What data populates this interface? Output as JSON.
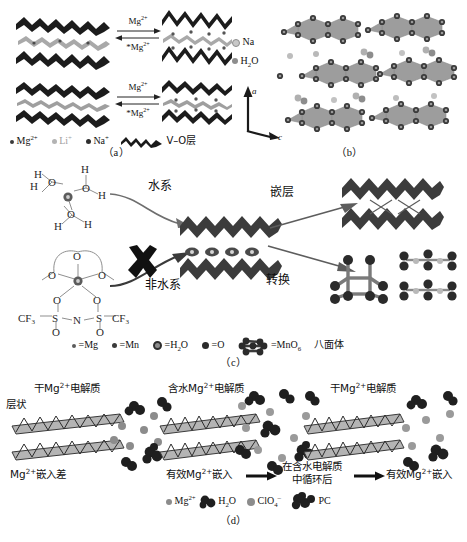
{
  "figure": {
    "panels": [
      {
        "id": "a",
        "label": "（a）"
      },
      {
        "id": "b",
        "label": "（b）"
      },
      {
        "id": "c",
        "label": "（c）"
      },
      {
        "id": "d",
        "label": "（d）"
      }
    ]
  },
  "panel_a": {
    "arrow_top_label": "Mg2+",
    "arrow_bottom_label": "*Mg2+",
    "arrow_top_label_sup": "2+",
    "arrow_bottom_label_sup": "2+",
    "rows": [
      {
        "left": "layered-host-narrow",
        "right": "layered-host-expanded"
      },
      {
        "left": "layered-host-narrow",
        "right": "layered-host-expanded"
      }
    ],
    "legend": [
      {
        "symbol": "dot-small-dark",
        "label": "Mg",
        "charge": "2+",
        "color": "#3a3a3a",
        "size": 4
      },
      {
        "symbol": "dot-light",
        "label": "Li",
        "charge": "+",
        "color": "#b3b3b3",
        "size": 5
      },
      {
        "symbol": "dot-dark",
        "label": "Na",
        "charge": "+",
        "color": "#2e2e2e",
        "size": 5
      },
      {
        "symbol": "vo-layer-glyph",
        "label": "V–O层",
        "charge": "",
        "color": "#1a1a1a",
        "size": 0
      }
    ]
  },
  "panel_b": {
    "legend": [
      {
        "symbol": "dot-light",
        "label": "Na",
        "color": "#9a9a9a"
      },
      {
        "symbol": "dot-dark",
        "label": "H2O",
        "label_sub": "2",
        "color": "#6e6e6e"
      }
    ],
    "axes": [
      {
        "label": "a",
        "direction": "up"
      },
      {
        "label": "c",
        "direction": "down-right"
      }
    ],
    "structure": "layered-crystal-with-polyhedra"
  },
  "panel_c": {
    "aqueous_label": "水系",
    "nonaqueous_label": "非水系",
    "intercalation_label": "嵌层",
    "conversion_label": "转换",
    "blocked_marker": "X",
    "hydrated_species": {
      "center": "Mg",
      "waters": [
        {
          "o": "O",
          "h": [
            "H",
            "H"
          ]
        },
        {
          "o": "O",
          "h": [
            "H",
            "H"
          ]
        },
        {
          "o": "O",
          "h": [
            "H",
            "H"
          ]
        }
      ]
    },
    "nonaqueous_species": {
      "center": "Mg",
      "glyme_oxygens": [
        "O",
        "O",
        "O"
      ],
      "anion_atoms": [
        "CF3",
        "S",
        "O",
        "O",
        "N",
        "S",
        "O",
        "O",
        "CF3"
      ],
      "anion_left": "CF3",
      "anion_right": "CF3",
      "anion_n": "N",
      "anion_s": "S",
      "anion_o": "O"
    },
    "legend": [
      {
        "symbol": "dot-tiny",
        "label": "=Mg",
        "color": "#5c5c5c",
        "size": 4
      },
      {
        "symbol": "dot-small",
        "label": "=Mn",
        "color": "#3b3b3b",
        "size": 5
      },
      {
        "symbol": "dot-ring",
        "label": "=H2O",
        "sub": "2",
        "color": "#8d8d8d",
        "size": 9
      },
      {
        "symbol": "dot-med",
        "label": "=O",
        "color": "#2b2b2b",
        "size": 7
      },
      {
        "symbol": "octahedron-cluster",
        "label": "=MnO6",
        "sub": "6",
        "color": "#2b2b2b",
        "size": 0
      },
      {
        "symbol": "text-only",
        "label": "八面体",
        "color": "#111",
        "size": 0
      }
    ]
  },
  "panel_d": {
    "stage_titles": [
      "干Mg2+电解质",
      "含水Mg2+电解质",
      "干Mg2+电解质"
    ],
    "layered_label": "层状",
    "captions": [
      "Mg2+嵌入差",
      "有效Mg2+嵌入",
      "有效Mg2+嵌入"
    ],
    "middle_arrow_text_line1": "在含水电解质",
    "middle_arrow_text_line2": "中循环后",
    "legend": [
      {
        "symbol": "dot-small",
        "label": "Mg",
        "charge": "2+",
        "color": "#8c8c8c"
      },
      {
        "symbol": "water-cluster",
        "label": "H2O",
        "sub": "2",
        "color": "#2b2b2b"
      },
      {
        "symbol": "dot-med",
        "label": "ClO4",
        "sub": "4",
        "charge": "–",
        "color": "#8c8c8c"
      },
      {
        "symbol": "pc-cluster",
        "label": "PC",
        "color": "#2b2b2b"
      }
    ]
  }
}
